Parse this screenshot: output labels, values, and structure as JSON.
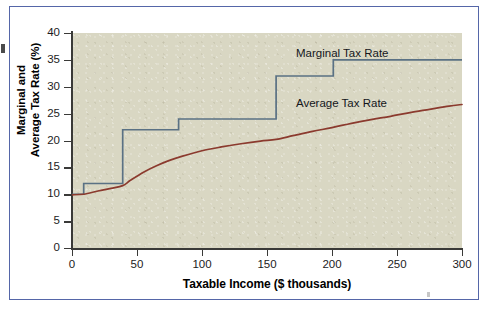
{
  "figure": {
    "frame_color": "#5566a8",
    "panel_color": "#d9d7c3",
    "page_color": "#ffffff"
  },
  "chart_data": {
    "type": "line",
    "title": "",
    "xlabel": "Taxable Income ($ thousands)",
    "ylabel": "Marginal and Average Tax Rate (%)",
    "ylabel_line1": "Marginal and",
    "ylabel_line2": "Average Tax Rate (%)",
    "xlim": [
      0,
      300
    ],
    "ylim": [
      0,
      40
    ],
    "xticks": [
      0,
      50,
      100,
      150,
      200,
      250,
      300
    ],
    "xtick_labels": [
      "0",
      "50",
      "100",
      "150",
      "200",
      "250",
      "300"
    ],
    "yticks": [
      0,
      5,
      10,
      15,
      20,
      25,
      30,
      35,
      40
    ],
    "ytick_labels": [
      "0",
      "5",
      "10",
      "15",
      "20",
      "25",
      "30",
      "35",
      "40"
    ],
    "grid": false,
    "legend_position": "inside-plot-annotations",
    "series": [
      {
        "name": "Marginal Tax Rate",
        "style": "step",
        "color": "#5a7184",
        "annotation": "Marginal Tax Rate",
        "brackets": [
          {
            "x_start": 0,
            "x_end": 9,
            "rate": 10
          },
          {
            "x_start": 9,
            "x_end": 39,
            "rate": 12
          },
          {
            "x_start": 39,
            "x_end": 82,
            "rate": 22
          },
          {
            "x_start": 82,
            "x_end": 157,
            "rate": 24
          },
          {
            "x_start": 157,
            "x_end": 201,
            "rate": 32
          },
          {
            "x_start": 201,
            "x_end": 300,
            "rate": 35
          }
        ]
      },
      {
        "name": "Average Tax Rate",
        "style": "smooth",
        "color": "#8b3a2e",
        "annotation": "Average Tax Rate",
        "x": [
          0,
          9,
          20,
          30,
          39,
          45,
          55,
          65,
          75,
          85,
          100,
          115,
          130,
          145,
          157,
          170,
          185,
          200,
          215,
          230,
          245,
          260,
          275,
          290,
          300
        ],
        "values": [
          9.9,
          10.0,
          10.6,
          11.1,
          11.6,
          12.6,
          14.1,
          15.3,
          16.3,
          17.1,
          18.1,
          18.8,
          19.4,
          19.9,
          20.2,
          20.9,
          21.7,
          22.4,
          23.2,
          23.9,
          24.5,
          25.2,
          25.8,
          26.4,
          26.7
        ]
      }
    ]
  }
}
